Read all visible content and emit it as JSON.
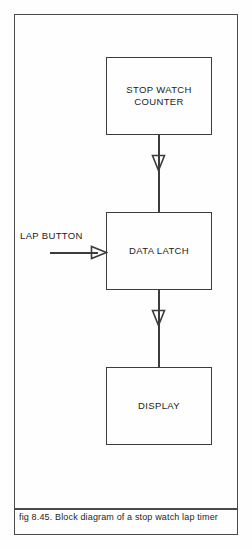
{
  "figure": {
    "caption": "fig 8.45. Block diagram of a stop watch lap timer",
    "frame_color": "#4a4a4a",
    "background_color": "#fefefe"
  },
  "diagram": {
    "type": "block-diagram",
    "line_color": "#3c3c3c",
    "text_color": "#1b1b1b",
    "blocks": [
      {
        "id": "stop-watch-counter",
        "label": "STOP WATCH\nCOUNTER"
      },
      {
        "id": "data-latch",
        "label": "DATA LATCH"
      },
      {
        "id": "display",
        "label": "DISPLAY"
      }
    ],
    "external_inputs": [
      {
        "id": "lap-button",
        "label": "LAP BUTTON",
        "target": "data-latch"
      }
    ],
    "connections": [
      {
        "from": "stop-watch-counter",
        "to": "data-latch",
        "direction": "down",
        "arrowhead": "open-triangle"
      },
      {
        "from": "data-latch",
        "to": "display",
        "direction": "down",
        "arrowhead": "open-triangle"
      },
      {
        "from": "lap-button",
        "to": "data-latch",
        "direction": "right",
        "arrowhead": "open-triangle"
      }
    ]
  }
}
